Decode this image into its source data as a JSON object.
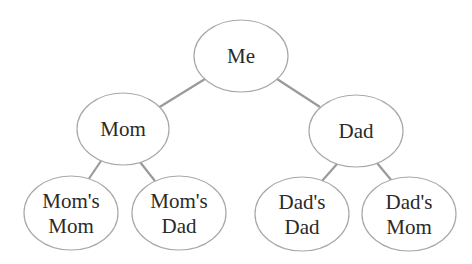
{
  "diagram": {
    "type": "family-tree",
    "nodes": [
      {
        "id": "me",
        "lines": [
          "Me"
        ],
        "cx": 241,
        "cy": 56,
        "rx": 47,
        "ry": 36
      },
      {
        "id": "mom",
        "lines": [
          "Mom"
        ],
        "cx": 123,
        "cy": 129,
        "rx": 46,
        "ry": 36
      },
      {
        "id": "dad",
        "lines": [
          "Dad"
        ],
        "cx": 356,
        "cy": 131,
        "rx": 47,
        "ry": 36
      },
      {
        "id": "moms-mom",
        "lines": [
          "Mom's",
          "Mom"
        ],
        "cx": 71,
        "cy": 213,
        "rx": 47,
        "ry": 37
      },
      {
        "id": "moms-dad",
        "lines": [
          "Mom's",
          "Dad"
        ],
        "cx": 179,
        "cy": 213,
        "rx": 47,
        "ry": 37
      },
      {
        "id": "dads-dad",
        "lines": [
          "Dad's",
          "Dad"
        ],
        "cx": 302,
        "cy": 214,
        "rx": 47,
        "ry": 37
      },
      {
        "id": "dads-mom",
        "lines": [
          "Dad's",
          "Mom"
        ],
        "cx": 409,
        "cy": 214,
        "rx": 47,
        "ry": 37
      }
    ],
    "edges": [
      {
        "from": "me",
        "to": "mom",
        "x1": 205,
        "y1": 79,
        "x2": 158,
        "y2": 108
      },
      {
        "from": "me",
        "to": "dad",
        "x1": 277,
        "y1": 79,
        "x2": 320,
        "y2": 107
      },
      {
        "from": "mom",
        "to": "moms-mom",
        "x1": 101,
        "y1": 161,
        "x2": 88,
        "y2": 180
      },
      {
        "from": "mom",
        "to": "moms-dad",
        "x1": 140,
        "y1": 162,
        "x2": 155,
        "y2": 181
      },
      {
        "from": "dad",
        "to": "dads-dad",
        "x1": 337,
        "y1": 164,
        "x2": 322,
        "y2": 181
      },
      {
        "from": "dad",
        "to": "dads-mom",
        "x1": 377,
        "y1": 163,
        "x2": 392,
        "y2": 181
      }
    ]
  }
}
